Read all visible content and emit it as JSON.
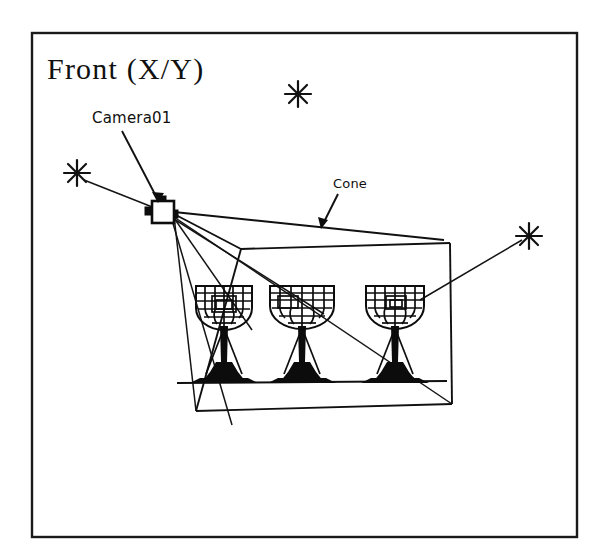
{
  "viewport": {
    "title": "Front (X/Y)",
    "frame": {
      "x": 32,
      "y": 33,
      "width": 545,
      "height": 504
    },
    "background_color": "#ffffff",
    "ink_color": "#101010"
  },
  "labels": {
    "camera": {
      "text": "Camera01",
      "x": 92,
      "y": 122,
      "leader_from": [
        121,
        128
      ],
      "leader_to": [
        160,
        201
      ]
    },
    "cone": {
      "text": "Cone",
      "x": 333,
      "y": 188,
      "leader_from": [
        340,
        194
      ],
      "leader_to": [
        322,
        226
      ]
    }
  },
  "camera_object": {
    "name": "Camera01",
    "icon": "camera-icon",
    "x": 151,
    "y": 201,
    "width": 24,
    "height": 24,
    "apex": [
      174,
      215
    ]
  },
  "cone": {
    "name": "Cone",
    "apex": [
      174,
      215
    ],
    "near_plane": [
      [
        241,
        249
      ],
      [
        443,
        241
      ]
    ],
    "far_plane": [
      [
        196,
        411
      ],
      [
        450,
        404
      ]
    ],
    "ground_line": [
      [
        177,
        383
      ],
      [
        443,
        381
      ]
    ]
  },
  "light_markers": [
    {
      "name": "light-top",
      "x": 298,
      "y": 94,
      "radius": 13,
      "connected": false
    },
    {
      "name": "light-left",
      "x": 77,
      "y": 173,
      "radius": 13,
      "connected": true,
      "target": [
        172,
        214
      ]
    },
    {
      "name": "light-right",
      "x": 529,
      "y": 236,
      "radius": 13,
      "connected": true,
      "target": [
        424,
        300
      ]
    }
  ],
  "goblets": [
    {
      "name": "goblet-1",
      "cx": 224,
      "bowl_top": 284,
      "bowl_bottom": 326,
      "bowl_rx": 28,
      "base_y": 383
    },
    {
      "name": "goblet-2",
      "cx": 302,
      "bowl_top": 284,
      "bowl_bottom": 326,
      "bowl_rx": 32,
      "base_y": 383
    },
    {
      "name": "goblet-3",
      "cx": 395,
      "bowl_top": 284,
      "bowl_bottom": 326,
      "bowl_rx": 29,
      "base_y": 383
    }
  ],
  "sight_lines": [
    {
      "name": "sight-line-1",
      "from": [
        174,
        215
      ],
      "to": [
        241,
        249
      ]
    },
    {
      "name": "sight-line-2",
      "from": [
        174,
        215
      ],
      "to": [
        443,
        241
      ]
    },
    {
      "name": "sight-line-3",
      "from": [
        174,
        215
      ],
      "to": [
        252,
        328
      ]
    },
    {
      "name": "sight-line-4",
      "from": [
        174,
        215
      ],
      "to": [
        322,
        312
      ]
    },
    {
      "name": "sight-line-5",
      "from": [
        174,
        215
      ],
      "to": [
        196,
        411
      ]
    },
    {
      "name": "sight-line-6",
      "from": [
        174,
        215
      ],
      "to": [
        450,
        404
      ]
    },
    {
      "name": "sight-line-7",
      "from": [
        174,
        215
      ],
      "to": [
        230,
        420
      ]
    }
  ]
}
